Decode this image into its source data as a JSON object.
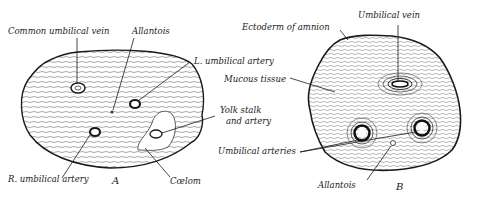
{
  "figure": {
    "panel_a": {
      "letter": "A",
      "labels": {
        "common_umbilical_vein": "Common umbilical vein",
        "allantois": "Allantois",
        "l_umbilical_artery": "L. umbilical artery",
        "yolk_stalk_line1": "Yolk stalk",
        "yolk_stalk_line2": "and artery",
        "r_umbilical_artery": "R. umbilical artery",
        "coelom": "Cœlom"
      }
    },
    "panel_b": {
      "letter": "B",
      "labels": {
        "ectoderm_of_amnion": "Ectoderm of amnion",
        "umbilical_vein": "Umbilical vein",
        "mucous_tissue": "Mucous tissue",
        "umbilical_arteries": "Umbilical arteries",
        "allantois": "Allantois"
      }
    },
    "colors": {
      "ink": "#1a1a1a",
      "background": "#ffffff"
    }
  }
}
